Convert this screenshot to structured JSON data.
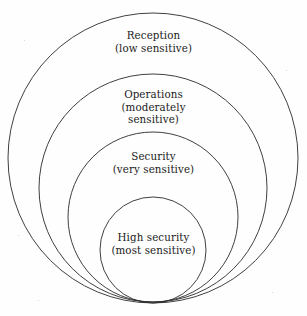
{
  "diagram": {
    "type": "concentric-circles",
    "background_color": "#fefefe",
    "stroke_color": "#2a2a2a",
    "text_color": "#1b1b1b",
    "zones": [
      {
        "id": "reception",
        "name": "Reception",
        "sensitivity": "(low sensitive)",
        "sensitivity_lines": [
          "(low sensitive)"
        ],
        "level": 1,
        "circle": {
          "cx": 153,
          "cy": 158,
          "r": 145
        }
      },
      {
        "id": "operations",
        "name": "Operations",
        "sensitivity": "(moderately sensitive)",
        "sensitivity_lines": [
          "(moderately",
          "sensitive)"
        ],
        "level": 2,
        "circle": {
          "cx": 153,
          "cy": 188,
          "r": 114
        }
      },
      {
        "id": "security",
        "name": "Security",
        "sensitivity": "(very sensitive)",
        "sensitivity_lines": [
          "(very sensitive)"
        ],
        "level": 3,
        "circle": {
          "cx": 153,
          "cy": 217,
          "r": 85
        }
      },
      {
        "id": "high-security",
        "name": "High security",
        "sensitivity": "(most sensitive)",
        "sensitivity_lines": [
          "(most sensitive)"
        ],
        "level": 4,
        "circle": {
          "cx": 153,
          "cy": 250,
          "r": 53
        }
      }
    ]
  }
}
